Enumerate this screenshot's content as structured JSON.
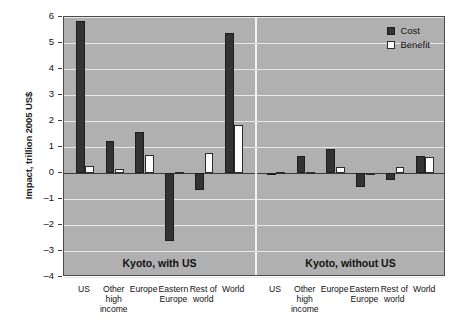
{
  "chart_data": {
    "type": "bar",
    "title": "",
    "xlabel": "",
    "ylabel": "Impact, trillion 2005 US$",
    "ylim": [
      -4,
      6
    ],
    "yticks": [
      6,
      5,
      4,
      3,
      2,
      1,
      0,
      -1,
      -2,
      -3,
      -4
    ],
    "ytick_labels": [
      "6",
      "5",
      "4",
      "3",
      "2",
      "1",
      "0",
      "–1",
      "–2",
      "–3",
      "–4"
    ],
    "grid": "horizontal",
    "legend_position": "top-right",
    "legend": [
      "Cost",
      "Benefit"
    ],
    "panels": [
      {
        "title": "Kyoto, with US",
        "categories": [
          "US",
          "Other high income",
          "Europe",
          "Eastern Europe",
          "Rest of world",
          "World"
        ],
        "series": [
          {
            "name": "Cost",
            "values": [
              5.85,
              1.25,
              1.57,
              -2.6,
              -0.65,
              5.4
            ]
          },
          {
            "name": "Benefit",
            "values": [
              0.27,
              0.17,
              0.7,
              0.05,
              0.78,
              1.85
            ]
          }
        ]
      },
      {
        "title": "Kyoto, without US",
        "categories": [
          "US",
          "Other high income",
          "Europe",
          "Eastern Europe",
          "Rest of world",
          "World"
        ],
        "series": [
          {
            "name": "Cost",
            "values": [
              -0.07,
              0.66,
              0.93,
              -0.55,
              -0.25,
              0.66
            ]
          },
          {
            "name": "Benefit",
            "values": [
              0.04,
              0.03,
              0.22,
              0.0,
              0.25,
              0.6
            ]
          }
        ]
      }
    ]
  },
  "axis": {
    "y_title": "Impact, trillion 2005 US$"
  },
  "legend": {
    "cost_label": "Cost",
    "benefit_label": "Benefit"
  },
  "panels": {
    "left_title": "Kyoto, with US",
    "right_title": "Kyoto, without US"
  },
  "categories": {
    "us": "US",
    "other_high_income": "Other\nhigh\nincome",
    "europe": "Europe",
    "eastern_europe": "Eastern\nEurope",
    "rest_of_world": "Rest of\nworld",
    "world": "World"
  },
  "colors": {
    "cost": "#333333",
    "benefit": "#fdfdfd",
    "plot_background": "#b0b0b0",
    "gridline": "#e8e8e8",
    "axis": "#3a3a3a"
  }
}
